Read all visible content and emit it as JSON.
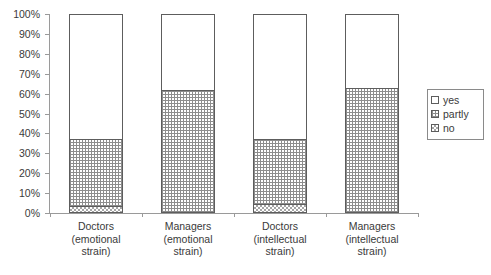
{
  "chart_data": {
    "type": "bar",
    "subtype": "100% stacked column",
    "title": "",
    "subtitle": "",
    "xlabel": "",
    "ylabel": "",
    "ylim": [
      0,
      100
    ],
    "yunit": "%",
    "grid": false,
    "legend_position": "right",
    "categories": [
      "Doctors (emotional strain)",
      "Managers (emotional strain)",
      "Doctors (intellectual strain)",
      "Managers (intellectual strain)"
    ],
    "category_lines": [
      [
        "Doctors",
        "(emotional",
        "strain)"
      ],
      [
        "Managers",
        "(emotional",
        "strain)"
      ],
      [
        "Doctors",
        "(intellectual",
        "strain)"
      ],
      [
        "Managers",
        "(intellectual",
        "strain)"
      ]
    ],
    "y_ticks": [
      "0%",
      "10%",
      "20%",
      "30%",
      "40%",
      "50%",
      "60%",
      "70%",
      "80%",
      "90%",
      "100%"
    ],
    "y_tick_values": [
      0,
      10,
      20,
      30,
      40,
      50,
      60,
      70,
      80,
      90,
      100
    ],
    "series": [
      {
        "name": "yes",
        "fill": "white",
        "values": [
          63,
          38,
          63,
          37
        ]
      },
      {
        "name": "partly",
        "fill": "fine-grid",
        "values": [
          34,
          62,
          33,
          63
        ]
      },
      {
        "name": "no",
        "fill": "checkered",
        "values": [
          3,
          0,
          4,
          0
        ]
      }
    ],
    "stack_order_bottom_to_top": [
      "no",
      "partly",
      "yes"
    ]
  },
  "legend": {
    "items": [
      {
        "label": "yes",
        "swatch": "swatch-white"
      },
      {
        "label": "partly",
        "swatch": "swatch-fine-grid"
      },
      {
        "label": "no",
        "swatch": "swatch-checkered"
      }
    ]
  },
  "colors": {
    "axis": "#9a9a9a",
    "bar_outline": "#5d5d5d",
    "pattern": "#8d8d8d",
    "text": "#3a3a3a",
    "background": "#ffffff"
  }
}
